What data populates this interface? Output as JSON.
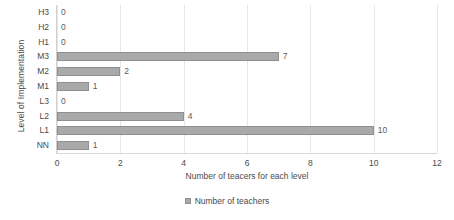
{
  "chart_data": {
    "type": "bar",
    "orientation": "horizontal",
    "title": "",
    "xlabel": "Number of teacers for each level",
    "ylabel": "Level of Implementation",
    "categories": [
      "H3",
      "H2",
      "H1",
      "M3",
      "M2",
      "M1",
      "L3",
      "L2",
      "L1",
      "NN"
    ],
    "values": [
      0,
      0,
      0,
      7,
      2,
      1,
      0,
      4,
      10,
      1
    ],
    "data_labels": [
      "0",
      "0",
      "0",
      "7",
      "2",
      "1",
      "0",
      "4",
      "10",
      "1"
    ],
    "xlim": [
      0,
      12
    ],
    "xticks": [
      0,
      2,
      4,
      6,
      8,
      10,
      12
    ],
    "xtick_labels": [
      "0",
      "2",
      "4",
      "6",
      "8",
      "10",
      "12"
    ],
    "grid": "vertical",
    "legend": {
      "position": "bottom",
      "entries": [
        {
          "name": "Number of teachers",
          "color": "#a9a9a9"
        }
      ]
    },
    "series": [
      {
        "name": "Number of teachers",
        "color": "#a9a9a9",
        "values": [
          0,
          0,
          0,
          7,
          2,
          1,
          0,
          4,
          10,
          1
        ]
      }
    ]
  },
  "colors": {
    "bar_fill": "#a9a9a9",
    "bar_border": "#8f8f8f",
    "gridline": "#e6e6e6",
    "axis_line": "#d0d0d0",
    "text": "#4a4a4a",
    "background": "#ffffff"
  }
}
